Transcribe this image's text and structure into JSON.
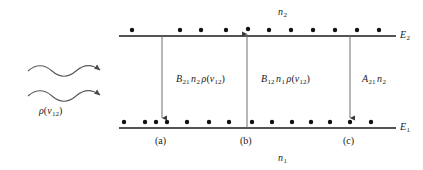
{
  "figure": {
    "background": "#ffffff",
    "ink": "#1a1a1a",
    "width": 423,
    "height": 170
  },
  "levels": {
    "upper": {
      "energy_label": "E",
      "energy_sub": "2",
      "population_label": "n",
      "population_sub": "2",
      "line_y": 36,
      "line_x1": 119,
      "line_x2": 396,
      "dot_count": 13,
      "dots_x": [
        132,
        180,
        200,
        226,
        248,
        268,
        290,
        312,
        334,
        356,
        378
      ]
    },
    "lower": {
      "energy_label": "E",
      "energy_sub": "1",
      "population_label": "n",
      "population_sub": "1",
      "line_y": 128,
      "line_x1": 119,
      "line_x2": 396,
      "dot_count": 16,
      "dots_x": [
        123,
        144,
        155,
        166,
        186,
        208,
        228,
        248,
        268,
        288,
        306,
        326,
        348,
        368
      ]
    }
  },
  "transitions": [
    {
      "id": "a",
      "case_label": "(a)",
      "x": 162,
      "direction": "down",
      "description": "stimulated-emission",
      "rate": {
        "coefficient": "B",
        "coefficient_sub": "21",
        "population": "n",
        "population_sub": "2",
        "density": "ρ",
        "density_var": "ν",
        "density_sub": "12",
        "text": "B21 n2 ρ(ν12)"
      },
      "label_x": 176,
      "label_y": 78
    },
    {
      "id": "b",
      "case_label": "(b)",
      "x": 247,
      "direction": "up",
      "description": "absorption",
      "rate": {
        "coefficient": "B",
        "coefficient_sub": "12",
        "population": "n",
        "population_sub": "1",
        "density": "ρ",
        "density_var": "ν",
        "density_sub": "12",
        "text": "B12 n1 ρ(ν12)"
      },
      "label_x": 261,
      "label_y": 78
    },
    {
      "id": "c",
      "case_label": "(c)",
      "x": 350,
      "direction": "down",
      "description": "spontaneous-emission",
      "rate": {
        "coefficient": "A",
        "coefficient_sub": "21",
        "population": "n",
        "population_sub": "2",
        "density": "",
        "density_var": "",
        "density_sub": "",
        "text": "A21 n2"
      },
      "label_x": 362,
      "label_y": 78
    }
  ],
  "incident_radiation": {
    "wave_count": 2,
    "label": "ρ",
    "label_var": "ν",
    "label_sub": "12",
    "label_text": "ρ(ν12)",
    "waves": [
      {
        "x1": 28,
        "x2": 106,
        "y": 71
      },
      {
        "x1": 28,
        "x2": 106,
        "y": 96
      }
    ],
    "label_x": 39,
    "label_y": 110
  }
}
